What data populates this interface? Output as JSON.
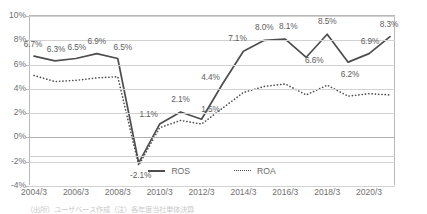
{
  "chart_data": {
    "type": "line",
    "title": "",
    "xlabel": "",
    "ylabel": "",
    "ylim": [
      -4,
      10
    ],
    "ystep": 2,
    "grid": true,
    "legend_position": "bottom-center",
    "x": [
      "2004/3",
      "2005/3",
      "2006/3",
      "2007/3",
      "2008/3",
      "2009/3",
      "2010/3",
      "2011/3",
      "2012/3",
      "2013/3",
      "2014/3",
      "2015/3",
      "2016/3",
      "2017/3",
      "2018/3",
      "2019/3",
      "2020/3",
      "2021/3"
    ],
    "xtick_labels": [
      "2004/3",
      "2006/3",
      "2008/3",
      "2010/3",
      "2012/3",
      "2014/3",
      "2016/3",
      "2018/3",
      "2020/3"
    ],
    "ytick_labels": [
      "10%",
      "8%",
      "6%",
      "4%",
      "2%",
      "0%",
      "-2%",
      "-4%"
    ],
    "ytick_values": [
      10,
      8,
      6,
      4,
      2,
      0,
      -2,
      -4
    ],
    "series": [
      {
        "name": "ROS",
        "style": "solid",
        "color": "#4d4d4d",
        "values": [
          6.7,
          6.3,
          6.5,
          6.9,
          6.5,
          -2.1,
          1.1,
          2.1,
          1.5,
          4.4,
          7.1,
          8.0,
          8.1,
          6.6,
          8.5,
          6.2,
          6.9,
          8.3
        ],
        "labels": [
          "6.7%",
          "6.3%",
          "6.5%",
          "6.9%",
          "6.5%",
          "-2.1%",
          "1.1%",
          "2.1%",
          "1.5%",
          "4.4%",
          "7.1%",
          "8.0%",
          "8.1%",
          "6.6%",
          "8.5%",
          "6.2%",
          "6.9%",
          "8.3%"
        ]
      },
      {
        "name": "ROA",
        "style": "dotted",
        "color": "#4d4d4d",
        "values": [
          5.1,
          4.6,
          4.7,
          4.9,
          5.0,
          -2.3,
          0.8,
          1.4,
          1.1,
          2.4,
          3.7,
          4.2,
          4.4,
          3.5,
          4.3,
          3.4,
          3.6,
          3.5
        ],
        "labels": []
      }
    ]
  },
  "legend": {
    "items": [
      {
        "label": "ROS",
        "style": "solid"
      },
      {
        "label": "ROA",
        "style": "dotted"
      }
    ]
  },
  "caption": {
    "text": "（出所）ユーザベース作成（注）各年度当社単体決算"
  }
}
